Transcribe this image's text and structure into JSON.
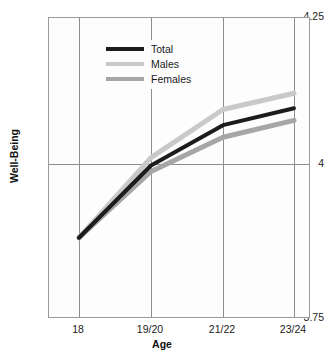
{
  "chart_data": {
    "type": "line",
    "title": "",
    "subtitle": "",
    "xlabel": "Age",
    "ylabel": "Well-Being",
    "categories": [
      "18",
      "19/20",
      "21/22",
      "23/24"
    ],
    "x_tick_labels": [
      "18",
      "19/20",
      "21/22",
      "23/24"
    ],
    "y_tick_labels": [
      "4.25",
      "4",
      "3.75"
    ],
    "ylim": [
      3.75,
      4.25
    ],
    "y_ticks": [
      3.75,
      4.0,
      4.25
    ],
    "grid": "both",
    "legend_position": "top-left",
    "series": [
      {
        "name": "Total",
        "color": "#1c1c1c",
        "values": [
          3.885,
          4.005,
          4.072,
          4.1
        ]
      },
      {
        "name": "Males",
        "color": "#c9c9c9",
        "values": [
          3.885,
          4.018,
          4.098,
          4.125
        ]
      },
      {
        "name": "Females",
        "color": "#a6a6a6",
        "values": [
          3.885,
          3.995,
          4.052,
          4.08
        ]
      }
    ]
  },
  "legend": {
    "items": [
      {
        "label": "Total"
      },
      {
        "label": "Males"
      },
      {
        "label": "Females"
      }
    ]
  },
  "axes": {
    "y_top_label": "4.25",
    "y_mid_label": "4",
    "y_bottom_label": "3.75",
    "y_title": "Well-Being",
    "x_title": "Age",
    "x_label_1": "18",
    "x_label_2": "19/20",
    "x_label_3": "21/22",
    "x_label_4": "23/24"
  },
  "colors": {
    "total": "#1c1c1c",
    "males": "#c9c9c9",
    "females": "#a6a6a6",
    "grid": "#8d8d8d",
    "frame": "#9a9a9a",
    "background": "#ffffff"
  }
}
